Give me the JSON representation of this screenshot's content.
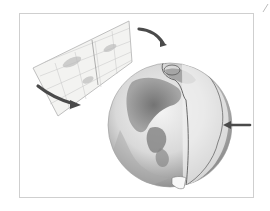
{
  "figure": {
    "elements": [
      {
        "name": "flat-map-panel",
        "kind": "projection grid"
      },
      {
        "name": "globe",
        "kind": "sphere with terrain"
      },
      {
        "name": "arrow-top",
        "direction": "clockwise toward globe"
      },
      {
        "name": "arrow-left",
        "direction": "downward curve from map"
      },
      {
        "name": "arrow-right",
        "direction": "pointing left at globe edge"
      }
    ],
    "colors": {
      "frame": "#cfcfcf",
      "map_fill": "#f3f3f1",
      "map_grid": "#b8b8b8",
      "globe_light": "#f2f2f2",
      "globe_dark": "#6e6e6e",
      "arrow": "#4a4a4a",
      "outline_line": "#5a5a5a"
    }
  }
}
